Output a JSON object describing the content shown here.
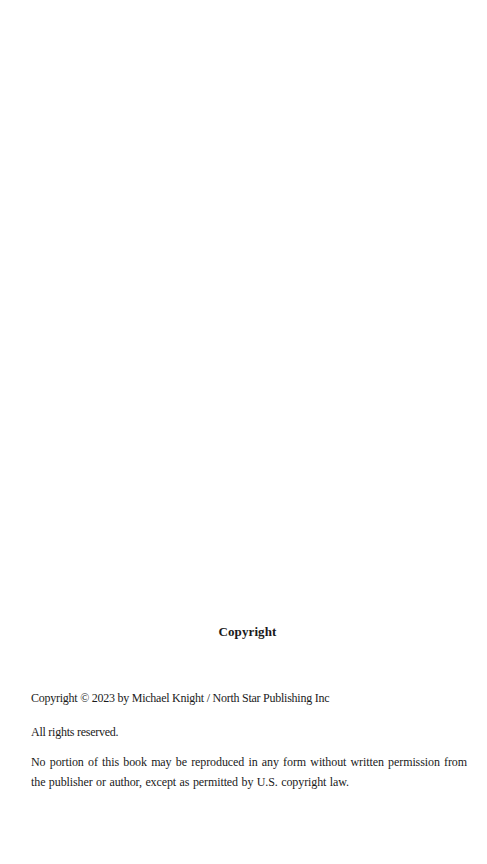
{
  "page": {
    "heading": "Copyright",
    "paragraphs": [
      "Copyright © 2023 by Michael Knight / North Star Publishing Inc",
      "All rights reserved.",
      "No portion of this book may be reproduced in any form without written permission from the publisher or author, except as permitted by U.S. copyright law."
    ]
  }
}
